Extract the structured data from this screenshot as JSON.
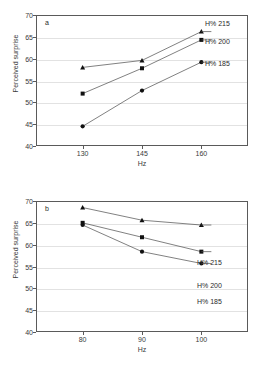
{
  "figure": {
    "panels": [
      {
        "letter": "a",
        "xlabel": "Hz",
        "ylabel": "Perceived surprise"
      },
      {
        "letter": "b",
        "xlabel": "Hz",
        "ylabel": "Perceived surprise"
      }
    ]
  },
  "chart_data": [
    {
      "type": "line",
      "title": "",
      "panel": "a",
      "xlabel": "Hz",
      "ylabel": "Perceived surprise",
      "x": [
        130,
        145,
        160
      ],
      "xtick_labels": [
        "130",
        "145",
        "160"
      ],
      "ylim": [
        40,
        70
      ],
      "yticks": [
        40,
        45,
        50,
        55,
        60,
        65,
        70
      ],
      "ytick_labels": [
        "40",
        "45",
        "50",
        "55",
        "60",
        "65",
        "70"
      ],
      "grid": true,
      "legend_position": "right-inside",
      "series": [
        {
          "name": "H% 215",
          "marker": "triangle",
          "values": [
            58.0,
            59.6,
            66.2
          ]
        },
        {
          "name": "H% 200",
          "marker": "square",
          "values": [
            52.0,
            57.8,
            64.3
          ]
        },
        {
          "name": "H% 185",
          "marker": "circle",
          "values": [
            44.5,
            52.7,
            59.2
          ]
        }
      ]
    },
    {
      "type": "line",
      "title": "",
      "panel": "b",
      "xlabel": "Hz",
      "ylabel": "Perceived surprise",
      "x": [
        80,
        90,
        100
      ],
      "xtick_labels": [
        "80",
        "90",
        "100"
      ],
      "ylim": [
        40,
        70
      ],
      "yticks": [
        40,
        45,
        50,
        55,
        60,
        65,
        70
      ],
      "ytick_labels": [
        "40",
        "45",
        "50",
        "55",
        "60",
        "65",
        "70"
      ],
      "grid": true,
      "legend_position": "right-inside",
      "series": [
        {
          "name": "H% 215",
          "marker": "triangle",
          "values": [
            68.5,
            65.6,
            64.5
          ]
        },
        {
          "name": "H% 200",
          "marker": "square",
          "values": [
            65.0,
            61.7,
            58.4
          ]
        },
        {
          "name": "H% 185",
          "marker": "circle",
          "values": [
            64.5,
            58.4,
            55.7
          ]
        }
      ]
    }
  ],
  "legend_labels": {
    "s215": "H% 215",
    "s200": "H% 200",
    "s185": "H% 185"
  }
}
